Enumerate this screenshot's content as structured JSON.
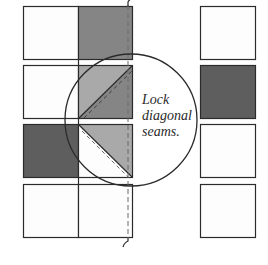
{
  "diagram": {
    "callout_text": [
      "Lock",
      "diagonal",
      "seams."
    ],
    "colors": {
      "outline": "#2b2b2b",
      "white": "#fdfdfd",
      "dark_gray": "#5e5e5e",
      "medium_gray": "#858585",
      "light_gray": "#a9a9a9"
    },
    "left_column_pairs": [
      {
        "row": 1,
        "left": "white",
        "right": "medium_gray"
      },
      {
        "row": 2,
        "left": "white",
        "right": "half-square triangle: light_gray upper-left / medium_gray lower-right"
      },
      {
        "row": 3,
        "left": "dark_gray",
        "right": "half-square triangle: light_gray upper-right / white lower-left"
      },
      {
        "row": 4,
        "left": "white",
        "right": "white"
      }
    ],
    "right_column_squares": [
      "white",
      "dark_gray",
      "white",
      "white"
    ]
  }
}
